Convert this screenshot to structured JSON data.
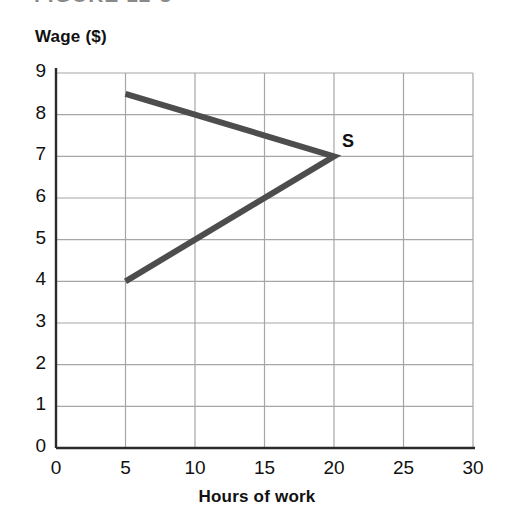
{
  "figure": {
    "caption_partial": "FIGURE 12-3"
  },
  "chart_data": {
    "type": "line",
    "title": "",
    "xlabel": "Hours of work",
    "ylabel": "Wage ($)",
    "xlim": [
      0,
      30
    ],
    "ylim": [
      0,
      9
    ],
    "xticks": [
      "0",
      "5",
      "10",
      "15",
      "20",
      "25",
      "30"
    ],
    "xtick_values": [
      0,
      5,
      10,
      15,
      20,
      25,
      30
    ],
    "yticks": [
      "0",
      "1",
      "2",
      "3",
      "4",
      "5",
      "6",
      "7",
      "8",
      "9"
    ],
    "ytick_values": [
      0,
      1,
      2,
      3,
      4,
      5,
      6,
      7,
      8,
      9
    ],
    "grid": true,
    "grid_color": "#a6a6a6",
    "axis_color": "#2a2a2a",
    "legend": "none",
    "series": [
      {
        "name": "S",
        "label": "S",
        "color": "#4d4d4d",
        "linewidth": 6,
        "description": "backward-bending labor supply curve",
        "points": [
          {
            "x": 5,
            "y": 4
          },
          {
            "x": 20,
            "y": 7
          },
          {
            "x": 5,
            "y": 8.5
          }
        ],
        "label_point": {
          "x": 20,
          "y": 7
        }
      }
    ],
    "annotations": [
      {
        "text": "S",
        "x": 20,
        "y": 7,
        "offset_x": 8,
        "offset_y": -14
      }
    ]
  }
}
